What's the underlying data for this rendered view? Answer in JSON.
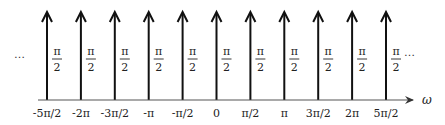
{
  "diagram": {
    "type": "impulse-train",
    "axis_label": "ω",
    "left_ellipsis": "…",
    "right_ellipsis": "…",
    "colors": {
      "stroke": "#111111",
      "axis": "#333333",
      "text": "#222222"
    },
    "impulses": [
      {
        "position": "-5π/2",
        "weight_num": "π",
        "weight_den": "2"
      },
      {
        "position": "-2π",
        "weight_num": "π",
        "weight_den": "2"
      },
      {
        "position": "-3π/2",
        "weight_num": "π",
        "weight_den": "2"
      },
      {
        "position": "-π",
        "weight_num": "π",
        "weight_den": "2"
      },
      {
        "position": "-π/2",
        "weight_num": "π",
        "weight_den": "2"
      },
      {
        "position": "0",
        "weight_num": "π",
        "weight_den": "2"
      },
      {
        "position": "π/2",
        "weight_num": "π",
        "weight_den": "2"
      },
      {
        "position": "π",
        "weight_num": "π",
        "weight_den": "2"
      },
      {
        "position": "3π/2",
        "weight_num": "π",
        "weight_den": "2"
      },
      {
        "position": "2π",
        "weight_num": "π",
        "weight_den": "2"
      },
      {
        "position": "5π/2",
        "weight_num": "π",
        "weight_den": "2"
      }
    ]
  }
}
